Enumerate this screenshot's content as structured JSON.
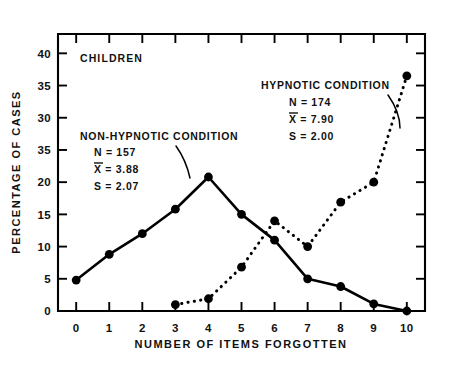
{
  "figure": {
    "group_label": "CHILDREN",
    "background": "#ffffff",
    "ink_color": "#000000"
  },
  "annotations": {
    "non_hypnotic": {
      "title": "NON-HYPNOTIC CONDITION",
      "n": "N = 157",
      "mean": "X = 3.88",
      "mean_symbol": "X",
      "sd": "S = 2.07"
    },
    "hypnotic": {
      "title": "HYPNOTIC CONDITION",
      "n": "N = 174",
      "mean": "X = 7.90",
      "mean_symbol": "X",
      "sd": "S = 2.00"
    }
  },
  "chart_data": {
    "type": "line",
    "title": "",
    "subtitle": "CHILDREN",
    "xlabel": "NUMBER OF ITEMS FORGOTTEN",
    "ylabel": "PERCENTAGE OF CASES",
    "x": [
      0,
      1,
      2,
      3,
      4,
      5,
      6,
      7,
      8,
      9,
      10
    ],
    "xticklabels": [
      "0",
      "1",
      "2",
      "3",
      "4",
      "5",
      "6",
      "7",
      "8",
      "9",
      "10"
    ],
    "xlim": [
      -0.55,
      10.55
    ],
    "ylim": [
      0,
      43
    ],
    "yticks": [
      0,
      5,
      10,
      15,
      20,
      25,
      30,
      35,
      40
    ],
    "yticklabels": [
      "0",
      "5",
      "10",
      "15",
      "20",
      "35",
      "30",
      "35",
      "40"
    ],
    "grid": false,
    "legend": "annotations-inline",
    "series": [
      {
        "name": "NON-HYPNOTIC CONDITION",
        "style": "solid",
        "marker": "filled-circle",
        "x": [
          0,
          1,
          2,
          3,
          4,
          5,
          6,
          7,
          8,
          9,
          10
        ],
        "values": [
          4.8,
          8.8,
          12.0,
          15.8,
          20.8,
          15.0,
          11.0,
          5.0,
          3.8,
          1.1,
          0.0
        ]
      },
      {
        "name": "HYPNOTIC CONDITION",
        "style": "dotted",
        "marker": "filled-circle",
        "x": [
          3,
          4,
          5,
          6,
          7,
          8,
          9,
          10
        ],
        "values": [
          1.0,
          1.9,
          6.8,
          14.0,
          10.0,
          16.9,
          20.0,
          36.5
        ]
      }
    ]
  }
}
